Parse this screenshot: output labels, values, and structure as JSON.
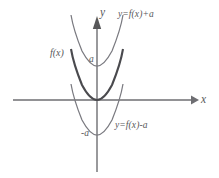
{
  "figure": {
    "kind": "coordinate-plane-diagram",
    "background_color": "#ffffff",
    "stroke_color": "#6e6e72",
    "curve_color": "#7a7a80",
    "emphasis_curve_color": "#4a4a4e",
    "text_color": "#58585a"
  },
  "axes": {
    "x_label": "x",
    "y_label": "y",
    "origin": {
      "x": 97,
      "y": 100
    },
    "x_axis": {
      "start_x": 13,
      "end_x": 195,
      "y": 100
    },
    "y_axis": {
      "x": 97,
      "start_y": 16,
      "end_y": 172
    }
  },
  "curves": [
    {
      "name": "shifted-up-parabola",
      "label": "y=f(x)+a",
      "vertex": {
        "x": 97,
        "y": 66
      },
      "emphasis": false
    },
    {
      "name": "base-parabola",
      "label": "f(x)",
      "vertex": {
        "x": 97,
        "y": 100
      },
      "emphasis": true
    },
    {
      "name": "shifted-down-parabola",
      "label": "y=f(x)-a",
      "vertex": {
        "x": 97,
        "y": 135
      },
      "emphasis": false
    }
  ],
  "tick_labels": {
    "positive_a": "a",
    "negative_a": "-a"
  }
}
